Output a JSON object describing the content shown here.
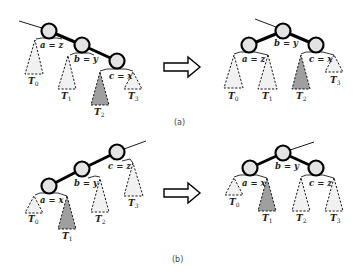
{
  "panels": [
    {
      "caption": "(a)",
      "before": {
        "nodes": [
          {
            "id": "a",
            "label": "a = z"
          },
          {
            "id": "b",
            "label": "b = y"
          },
          {
            "id": "c",
            "label": "c = x"
          }
        ],
        "subtrees": [
          {
            "name": "T",
            "sub": "0",
            "highlighted": false
          },
          {
            "name": "T",
            "sub": "1",
            "highlighted": false
          },
          {
            "name": "T",
            "sub": "2",
            "highlighted": true
          },
          {
            "name": "T",
            "sub": "3",
            "highlighted": false
          }
        ]
      },
      "after": {
        "nodes": [
          {
            "id": "b",
            "label": "b = y"
          },
          {
            "id": "a",
            "label": "a = z"
          },
          {
            "id": "c",
            "label": "c = x"
          }
        ],
        "subtrees": [
          {
            "name": "T",
            "sub": "0",
            "highlighted": false
          },
          {
            "name": "T",
            "sub": "1",
            "highlighted": false
          },
          {
            "name": "T",
            "sub": "2",
            "highlighted": true
          },
          {
            "name": "T",
            "sub": "3",
            "highlighted": false
          }
        ]
      }
    },
    {
      "caption": "(b)",
      "before": {
        "nodes": [
          {
            "id": "c",
            "label": "c = z"
          },
          {
            "id": "b",
            "label": "b = y"
          },
          {
            "id": "a",
            "label": "a = x"
          }
        ],
        "subtrees": [
          {
            "name": "T",
            "sub": "0",
            "highlighted": false
          },
          {
            "name": "T",
            "sub": "1",
            "highlighted": true
          },
          {
            "name": "T",
            "sub": "2",
            "highlighted": false
          },
          {
            "name": "T",
            "sub": "3",
            "highlighted": false
          }
        ]
      },
      "after": {
        "nodes": [
          {
            "id": "b",
            "label": "b = y"
          },
          {
            "id": "a",
            "label": "a = x"
          },
          {
            "id": "c",
            "label": "c = z"
          }
        ],
        "subtrees": [
          {
            "name": "T",
            "sub": "0",
            "highlighted": false
          },
          {
            "name": "T",
            "sub": "1",
            "highlighted": true
          },
          {
            "name": "T",
            "sub": "2",
            "highlighted": false
          },
          {
            "name": "T",
            "sub": "3",
            "highlighted": false
          }
        ]
      }
    }
  ],
  "colors": {
    "node_fill": "#e3e3e3",
    "subtree_fill": "#f1f1f1",
    "highlight_fill": "#9f9f9f"
  }
}
